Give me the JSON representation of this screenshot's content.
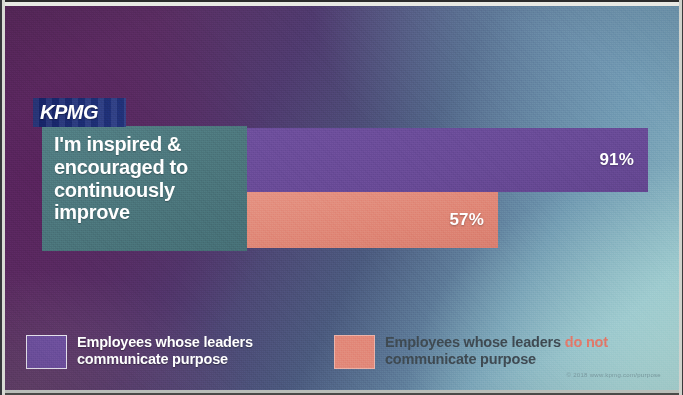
{
  "slide": {
    "brand": "KPMG",
    "statement": "I'm inspired & encouraged to continuously improve",
    "fine_print": "© 2018  www.kpmg.com/purpose"
  },
  "legend": {
    "items": [
      {
        "key": "communicate",
        "label_line1": "Employees whose leaders",
        "label_line2": "communicate purpose",
        "color": "#6f51a0"
      },
      {
        "key": "not_communicate",
        "label_part1": "Employees whose leaders ",
        "label_emphasis": "do not",
        "label_part2": " communicate purpose",
        "color": "#e2897a"
      }
    ]
  },
  "chart_data": {
    "type": "bar",
    "orientation": "horizontal",
    "title": "I'm inspired & encouraged to continuously improve",
    "categories": [
      "I'm inspired & encouraged to continuously improve"
    ],
    "xlabel": "",
    "ylabel": "",
    "xlim": [
      0,
      100
    ],
    "unit": "%",
    "grid": false,
    "legend_position": "bottom",
    "data_labels": true,
    "series": [
      {
        "name": "Employees whose leaders communicate purpose",
        "values": [
          91
        ],
        "label": "91%",
        "color": "#6f51a0"
      },
      {
        "name": "Employees whose leaders do not communicate purpose",
        "values": [
          57
        ],
        "label": "57%",
        "color": "#e2897a"
      }
    ]
  }
}
